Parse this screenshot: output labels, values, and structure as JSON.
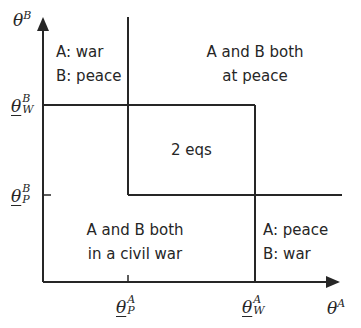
{
  "diagram": {
    "axes": {
      "x_label": {
        "symbol": "θ",
        "superscript": "A"
      },
      "y_label": {
        "symbol": "θ",
        "superscript": "B"
      }
    },
    "x_ticks": [
      {
        "symbol": "θ",
        "superscript": "A",
        "subscript": "P",
        "underline": true
      },
      {
        "symbol": "θ",
        "superscript": "A",
        "subscript": "W",
        "underline": true
      }
    ],
    "y_ticks": [
      {
        "symbol": "θ",
        "superscript": "B",
        "subscript": "W",
        "underline": true
      },
      {
        "symbol": "θ",
        "superscript": "B",
        "subscript": "P",
        "underline": true
      }
    ],
    "regions": {
      "top_left": {
        "line1": "A: war",
        "line2": "B: peace"
      },
      "top_right": {
        "line1": "A and B both",
        "line2": "at peace"
      },
      "middle": {
        "line1": "2 eqs"
      },
      "bottom_left": {
        "line1": "A and B both",
        "line2": "in a civil war"
      },
      "bottom_right": {
        "line1": "A: peace",
        "line2": "B: war"
      }
    },
    "colors": {
      "line": "#262626",
      "text": "#262626",
      "background": "#ffffff"
    }
  }
}
